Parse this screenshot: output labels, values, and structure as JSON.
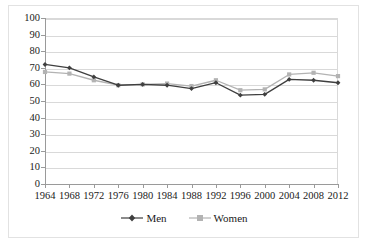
{
  "chart_data": {
    "type": "line",
    "title": "",
    "subtitle": "",
    "xlabel": "",
    "ylabel": "",
    "categories": [
      "1964",
      "1968",
      "1972",
      "1976",
      "1980",
      "1984",
      "1988",
      "1992",
      "1996",
      "2000",
      "2004",
      "2008",
      "2012"
    ],
    "x": [
      1964,
      1968,
      1972,
      1976,
      1980,
      1984,
      1988,
      1992,
      1996,
      2000,
      2004,
      2008,
      2012
    ],
    "series": [
      {
        "name": "Men",
        "color": "#3f3f3f",
        "marker": "diamond",
        "values": [
          72,
          70,
          64.5,
          59.5,
          60,
          59.5,
          57.5,
          61,
          53.5,
          54,
          63,
          62.5,
          61
        ]
      },
      {
        "name": "Women",
        "color": "#b3b3b3",
        "marker": "square",
        "values": [
          67.5,
          66.5,
          62.5,
          59.5,
          60,
          60.5,
          59,
          62.5,
          56.5,
          57,
          66,
          67,
          65
        ]
      }
    ],
    "ylim": [
      0,
      100
    ],
    "ytick_step": 10,
    "yticks": [
      "100",
      "90",
      "80",
      "70",
      "60",
      "50",
      "40",
      "30",
      "20",
      "10",
      "0"
    ],
    "grid": true,
    "grid_axis": "y",
    "legend_position": "bottom",
    "xlim": [
      1964,
      2012
    ]
  },
  "legend": {
    "entries": [
      {
        "label": "Men"
      },
      {
        "label": "Women"
      }
    ]
  },
  "colors": {
    "men": "#3f3f3f",
    "women": "#b3b3b3",
    "gridline": "#d9d9d9",
    "axis": "#9a9a9a",
    "frame_border": "#e2e2e2",
    "text": "#1a1a1a",
    "background": "#ffffff"
  }
}
